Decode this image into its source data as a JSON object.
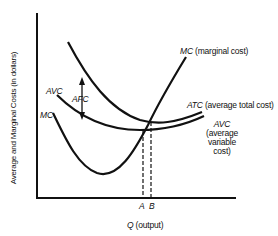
{
  "diagram": {
    "y_axis_label": "Average and Marginal Costs (in dollars)",
    "x_axis_label_symbol": "Q",
    "x_axis_label_text": "(output)",
    "curves": {
      "mc": {
        "label_top": "MC",
        "label_top_desc": "(marginal cost)",
        "label_left": "MC"
      },
      "atc": {
        "label": "ATC",
        "label_desc": "(average total cost)"
      },
      "avc": {
        "label_right": "AVC",
        "label_right_desc_1": "(average",
        "label_right_desc_2": "variable",
        "label_right_desc_3": "cost)",
        "label_left": "AVC"
      }
    },
    "afc_label": "AFC",
    "points": {
      "a": "A",
      "b": "B"
    },
    "colors": {
      "line": "#111111",
      "background": "#ffffff"
    }
  }
}
